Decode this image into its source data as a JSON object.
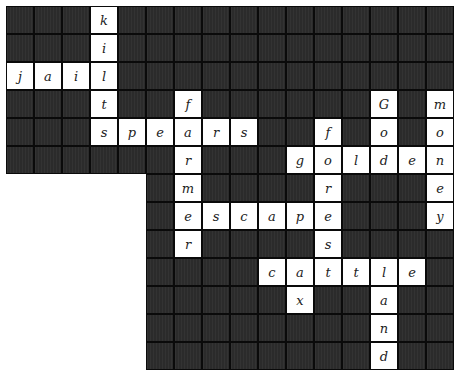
{
  "puzzle": {
    "rows": 13,
    "cols": 16,
    "cell_size": 28,
    "region_note": "columns 0-5 present only in rows 0-5",
    "colors": {
      "block": "#2b2b2b",
      "open": "#ffffff",
      "border": "#0a0a0a"
    },
    "cells": [
      {
        "r": 0,
        "c": 3,
        "ch": "k"
      },
      {
        "r": 1,
        "c": 3,
        "ch": "i"
      },
      {
        "r": 2,
        "c": 0,
        "ch": "j"
      },
      {
        "r": 2,
        "c": 1,
        "ch": "a"
      },
      {
        "r": 2,
        "c": 2,
        "ch": "i"
      },
      {
        "r": 2,
        "c": 3,
        "ch": "l"
      },
      {
        "r": 3,
        "c": 3,
        "ch": "t"
      },
      {
        "r": 3,
        "c": 6,
        "ch": "f"
      },
      {
        "r": 3,
        "c": 13,
        "ch": "G"
      },
      {
        "r": 3,
        "c": 15,
        "ch": "m"
      },
      {
        "r": 4,
        "c": 3,
        "ch": "s"
      },
      {
        "r": 4,
        "c": 4,
        "ch": "p"
      },
      {
        "r": 4,
        "c": 5,
        "ch": "e"
      },
      {
        "r": 4,
        "c": 6,
        "ch": "a"
      },
      {
        "r": 4,
        "c": 7,
        "ch": "r"
      },
      {
        "r": 4,
        "c": 8,
        "ch": "s"
      },
      {
        "r": 4,
        "c": 11,
        "ch": "f"
      },
      {
        "r": 4,
        "c": 13,
        "ch": "o"
      },
      {
        "r": 4,
        "c": 15,
        "ch": "o"
      },
      {
        "r": 5,
        "c": 6,
        "ch": "r"
      },
      {
        "r": 5,
        "c": 10,
        "ch": "g"
      },
      {
        "r": 5,
        "c": 11,
        "ch": "o"
      },
      {
        "r": 5,
        "c": 12,
        "ch": "l"
      },
      {
        "r": 5,
        "c": 13,
        "ch": "d"
      },
      {
        "r": 5,
        "c": 14,
        "ch": "e"
      },
      {
        "r": 5,
        "c": 15,
        "ch": "n"
      },
      {
        "r": 6,
        "c": 6,
        "ch": "m"
      },
      {
        "r": 6,
        "c": 11,
        "ch": "r"
      },
      {
        "r": 6,
        "c": 15,
        "ch": "e"
      },
      {
        "r": 7,
        "c": 6,
        "ch": "e"
      },
      {
        "r": 7,
        "c": 7,
        "ch": "s"
      },
      {
        "r": 7,
        "c": 8,
        "ch": "c"
      },
      {
        "r": 7,
        "c": 9,
        "ch": "a"
      },
      {
        "r": 7,
        "c": 10,
        "ch": "p"
      },
      {
        "r": 7,
        "c": 11,
        "ch": "e"
      },
      {
        "r": 7,
        "c": 15,
        "ch": "y"
      },
      {
        "r": 8,
        "c": 6,
        "ch": "r"
      },
      {
        "r": 8,
        "c": 11,
        "ch": "s"
      },
      {
        "r": 9,
        "c": 9,
        "ch": "c"
      },
      {
        "r": 9,
        "c": 10,
        "ch": "a"
      },
      {
        "r": 9,
        "c": 11,
        "ch": "t"
      },
      {
        "r": 9,
        "c": 12,
        "ch": "t"
      },
      {
        "r": 9,
        "c": 13,
        "ch": "l"
      },
      {
        "r": 9,
        "c": 14,
        "ch": "e"
      },
      {
        "r": 10,
        "c": 10,
        "ch": "x"
      },
      {
        "r": 10,
        "c": 13,
        "ch": "a"
      },
      {
        "r": 11,
        "c": 13,
        "ch": "n"
      },
      {
        "r": 12,
        "c": 13,
        "ch": "d"
      }
    ],
    "words": [
      "kilts",
      "jail",
      "spears",
      "farmer",
      "Gold",
      "money",
      "fores",
      "golden",
      "escape",
      "cattle",
      "ox",
      "land"
    ]
  }
}
